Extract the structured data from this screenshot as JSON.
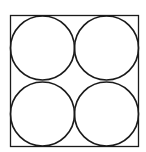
{
  "diagram": {
    "stroke_color": "#1a1a1a",
    "background": "#ffffff",
    "square": {
      "x": 10.5,
      "y": 15.5,
      "width": 128,
      "height": 131
    },
    "circles": [
      {
        "cx": 42.5,
        "cy": 48,
        "r": 32
      },
      {
        "cx": 106.5,
        "cy": 48,
        "r": 32
      },
      {
        "cx": 42.5,
        "cy": 114,
        "r": 32
      },
      {
        "cx": 106.5,
        "cy": 114,
        "r": 32
      }
    ]
  }
}
